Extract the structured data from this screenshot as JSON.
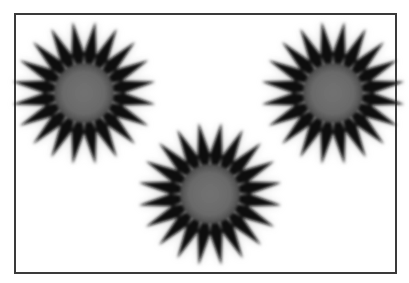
{
  "canvas": {
    "width": 409,
    "height": 283,
    "background": "#ffffff"
  },
  "frame": {
    "x": 14,
    "y": 13,
    "width": 383,
    "height": 261,
    "stroke": "#3a3a3a",
    "stroke_width": 2
  },
  "style": {
    "ray_color": "#0e0e0e",
    "core_color": "#6e6e6e",
    "core_highlight": "#bdbdbd",
    "blur_glow": "#9a9a9a"
  },
  "stars": [
    {
      "name": "star-top-left",
      "cx": 84,
      "cy": 93,
      "outer_r": 72,
      "inner_r": 40,
      "core_r": 33,
      "rays": 20,
      "rotation": 9
    },
    {
      "name": "star-bottom-center",
      "cx": 210,
      "cy": 194,
      "outer_r": 72,
      "inner_r": 40,
      "core_r": 33,
      "rays": 20,
      "rotation": 9
    },
    {
      "name": "star-top-right",
      "cx": 333,
      "cy": 93,
      "outer_r": 72,
      "inner_r": 40,
      "core_r": 33,
      "rays": 20,
      "rotation": 9
    }
  ]
}
